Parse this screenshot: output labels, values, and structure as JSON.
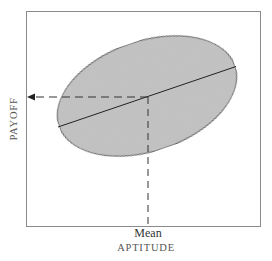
{
  "diagram": {
    "type": "regression-scatter-ellipse",
    "x_axis": {
      "label": "APTITUDE",
      "marker_label": "Mean"
    },
    "y_axis": {
      "label": "PAYOFF"
    },
    "colors": {
      "frame": "#8a8a8a",
      "ellipse_fill": "#bdbdbd",
      "ellipse_stroke": "#333333",
      "regression_line": "#222222",
      "dashed_lines": "#333333",
      "text": "#444444"
    },
    "elements": {
      "ellipse": "Scatter region (shaded ellipse) tilted upward to the right",
      "regression_line": "Solid line through ellipse along major axis",
      "vertical_dashed": "Dashed line rising from Mean on aptitude axis to regression line",
      "horizontal_dashed_arrow": "Dashed arrow from regression line pointing left to payoff axis"
    }
  }
}
